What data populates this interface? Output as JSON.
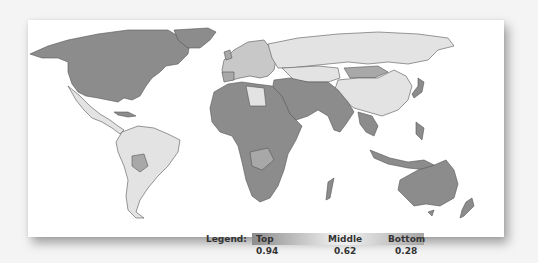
{
  "legend": {
    "label": "Legend:",
    "top_label": "Top",
    "middle_label": "Middle",
    "bottom_label": "Bottom",
    "top_value": "0.94",
    "middle_value": "0.62",
    "bottom_value": "0.28"
  },
  "colors": {
    "top": "#8c8c8c",
    "middle": "#e3e3e3",
    "bottom": "#a8a8a8",
    "border": "#555555",
    "card": "#ffffff",
    "background": "#f4f4f4"
  },
  "regions": [
    {
      "name": "North America",
      "shade": "top"
    },
    {
      "name": "Greenland",
      "shade": "top"
    },
    {
      "name": "Central America / Mexico",
      "shade": "middle"
    },
    {
      "name": "South America",
      "shade": "middle"
    },
    {
      "name": "Europe",
      "shade": "mixed"
    },
    {
      "name": "Russia",
      "shade": "middle"
    },
    {
      "name": "China",
      "shade": "middle"
    },
    {
      "name": "Middle East / South Asia",
      "shade": "top"
    },
    {
      "name": "Africa",
      "shade": "top"
    },
    {
      "name": "Southeast Asia",
      "shade": "top"
    },
    {
      "name": "Australia",
      "shade": "top"
    }
  ]
}
